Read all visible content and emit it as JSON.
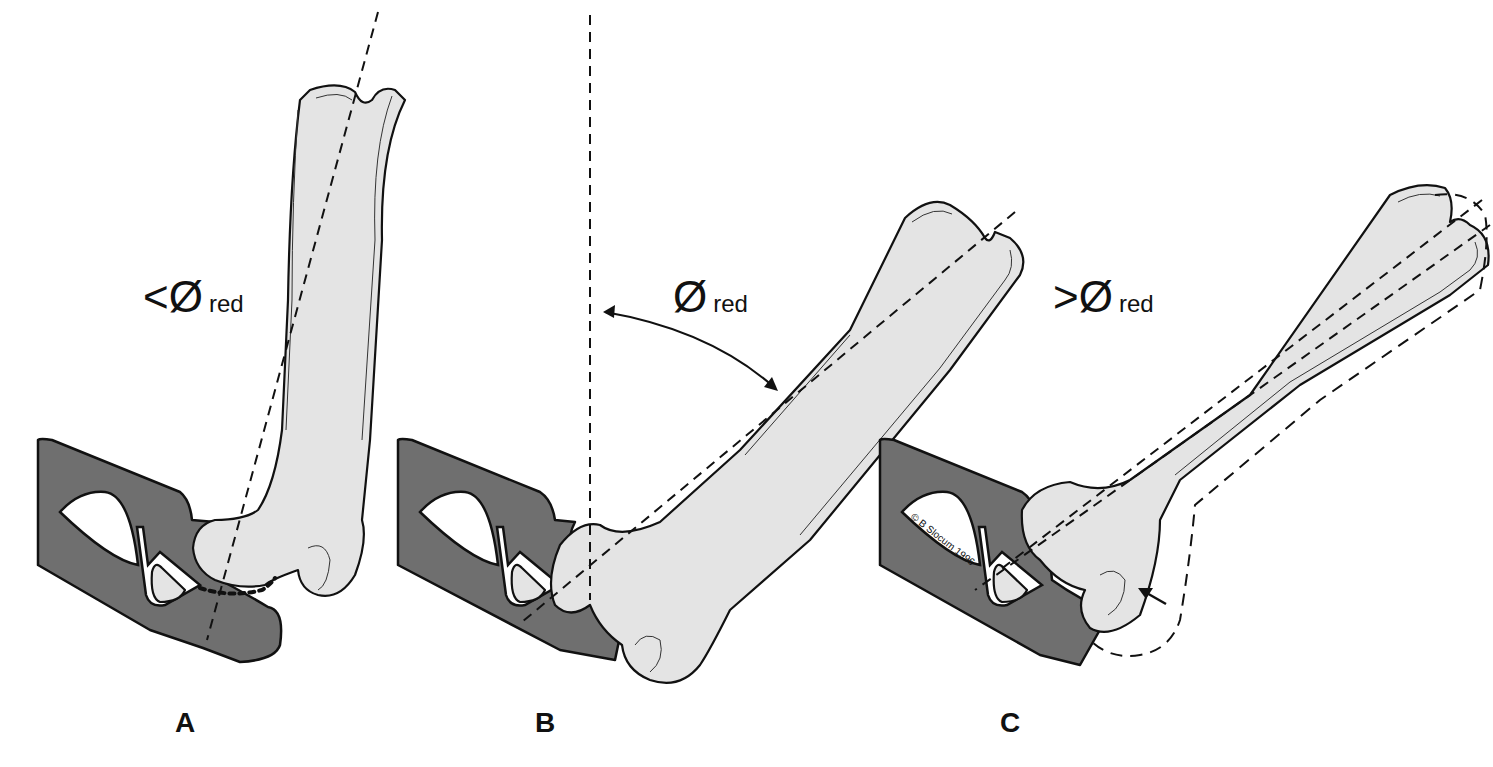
{
  "figure": {
    "panels": [
      {
        "id": "A",
        "label": "A",
        "angle_prefix": "<",
        "angle_symbol": "Ø",
        "angle_subscript": "red",
        "meaning": "less than angle of reduction"
      },
      {
        "id": "B",
        "label": "B",
        "angle_prefix": "",
        "angle_symbol": "Ø",
        "angle_subscript": "red",
        "meaning": "angle of reduction"
      },
      {
        "id": "C",
        "label": "C",
        "angle_prefix": ">",
        "angle_symbol": "Ø",
        "angle_subscript": "red",
        "meaning": "greater than angle of reduction"
      }
    ],
    "copyright": "© B Slocum 1996",
    "colors": {
      "pelvis_fill": "#6f6f6f",
      "bone_fill": "#e4e4e4",
      "outline": "#111111",
      "background": "#ffffff"
    }
  }
}
